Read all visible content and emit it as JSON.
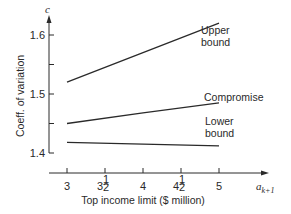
{
  "chart_data": {
    "type": "line",
    "title": "",
    "xlabel": "Top income limit ($ million)",
    "ylabel": "Coeff. of variation",
    "x_axis_symbol": "a",
    "x_axis_symbol_sub": "k+1",
    "y_axis_symbol": "c",
    "x_ticks": [
      {
        "value": 3,
        "label": "3"
      },
      {
        "value": 3.5,
        "label": "3",
        "frac": "1/2"
      },
      {
        "value": 4,
        "label": "4"
      },
      {
        "value": 4.5,
        "label": "4",
        "frac": "1/2"
      },
      {
        "value": 5,
        "label": "5"
      }
    ],
    "y_ticks": [
      {
        "value": 1.4,
        "label": "1.4"
      },
      {
        "value": 1.45,
        "label": ""
      },
      {
        "value": 1.5,
        "label": "1.5"
      },
      {
        "value": 1.55,
        "label": ""
      },
      {
        "value": 1.6,
        "label": "1.6"
      }
    ],
    "xlim": [
      3,
      5
    ],
    "ylim": [
      1.4,
      1.6
    ],
    "grid": false,
    "legend": "inline labels at right end of lines",
    "x": [
      3,
      4,
      5
    ],
    "series": [
      {
        "name": "Upper bound",
        "label_lines": [
          "Upper",
          "bound"
        ],
        "values": [
          1.52,
          1.57,
          1.62
        ]
      },
      {
        "name": "Compromise",
        "label_lines": [
          "Compromise"
        ],
        "values": [
          1.45,
          1.468,
          1.485
        ]
      },
      {
        "name": "Lower bound",
        "label_lines": [
          "Lower",
          "bound"
        ],
        "values": [
          1.418,
          1.415,
          1.412
        ]
      }
    ]
  }
}
